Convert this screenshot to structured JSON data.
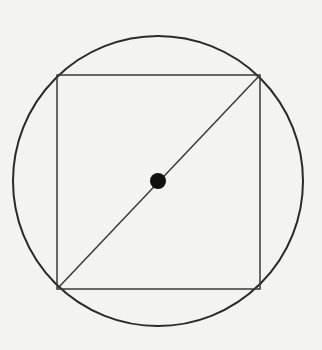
{
  "diagram": {
    "background": "#f3f3f1",
    "stroke_color": "#2a2a2a",
    "circle": {
      "cx": 158,
      "cy": 181,
      "r": 145
    },
    "square": {
      "x": 57,
      "y": 75,
      "width": 203,
      "height": 214
    },
    "diagonal": {
      "x1": 58,
      "y1": 288,
      "x2": 259,
      "y2": 76
    },
    "center_dot": {
      "cx": 158,
      "cy": 181,
      "r": 8
    }
  }
}
